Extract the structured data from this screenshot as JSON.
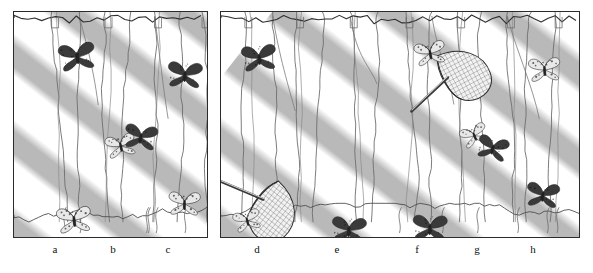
{
  "figure": {
    "panel_count": 2,
    "background_color": "#ffffff",
    "ink_color": "#2b2b2b",
    "shade_band_color": "#b9b9b9",
    "sun_band_color": "#ffffff",
    "dark_morph_color": "#3a3a3a",
    "pale_morph_color": "#e8e8e8"
  },
  "panels": [
    {
      "id": "panel-left",
      "name": "left-panel",
      "x": 13,
      "y": 11,
      "width": 195,
      "height": 227,
      "labels": [
        {
          "text": "a",
          "x": 55
        },
        {
          "text": "b",
          "x": 113
        },
        {
          "text": "c",
          "x": 168
        }
      ],
      "trunks_x": [
        38,
        66,
        92,
        118,
        142,
        168,
        190
      ],
      "butterflies": [
        {
          "name": "butterfly-dark-upper-left",
          "morph": "dark",
          "x": 63,
          "y": 44,
          "size": 40,
          "rot": -8
        },
        {
          "name": "butterfly-dark-upper-right",
          "morph": "dark",
          "x": 171,
          "y": 62,
          "size": 38,
          "rot": 4
        },
        {
          "name": "butterfly-pale-mid-pair",
          "morph": "pale",
          "x": 106,
          "y": 133,
          "size": 33,
          "rot": -12
        },
        {
          "name": "butterfly-dark-mid-pair",
          "morph": "dark",
          "x": 127,
          "y": 124,
          "size": 36,
          "rot": 8
        },
        {
          "name": "butterfly-pale-lower-left",
          "morph": "pale",
          "x": 60,
          "y": 207,
          "size": 38,
          "rot": -6
        },
        {
          "name": "butterfly-pale-lower-right",
          "morph": "pale",
          "x": 170,
          "y": 191,
          "size": 35,
          "rot": 2
        }
      ],
      "nets": []
    },
    {
      "id": "panel-right",
      "name": "right-panel",
      "x": 220,
      "y": 11,
      "width": 360,
      "height": 227,
      "labels": [
        {
          "text": "d",
          "x": 257
        },
        {
          "text": "e",
          "x": 337
        },
        {
          "text": "f",
          "x": 417
        },
        {
          "text": "g",
          "x": 477
        },
        {
          "text": "h",
          "x": 533
        }
      ],
      "trunks_x": [
        24,
        52,
        76,
        102,
        130,
        158,
        186,
        212,
        238,
        262,
        288,
        312,
        336
      ],
      "butterflies": [
        {
          "name": "butterfly-dark-upper-left",
          "morph": "dark",
          "x": 38,
          "y": 45,
          "size": 38,
          "rot": -6
        },
        {
          "name": "butterfly-pale-netted-lower",
          "morph": "pale",
          "x": 26,
          "y": 208,
          "size": 30,
          "rot": -14
        },
        {
          "name": "butterfly-dark-bottom-e",
          "morph": "dark",
          "x": 128,
          "y": 217,
          "size": 38,
          "rot": 4
        },
        {
          "name": "butterfly-pale-top-f",
          "morph": "pale",
          "x": 209,
          "y": 40,
          "size": 34,
          "rot": -10
        },
        {
          "name": "butterfly-dark-bottom-f",
          "morph": "dark",
          "x": 209,
          "y": 215,
          "size": 38,
          "rot": 2
        },
        {
          "name": "butterfly-pale-mid-g",
          "morph": "pale",
          "x": 253,
          "y": 123,
          "size": 30,
          "rot": -22
        },
        {
          "name": "butterfly-dark-mid-g",
          "morph": "dark",
          "x": 272,
          "y": 135,
          "size": 34,
          "rot": 14
        },
        {
          "name": "butterfly-pale-top-h",
          "morph": "pale",
          "x": 323,
          "y": 57,
          "size": 35,
          "rot": -4
        },
        {
          "name": "butterfly-dark-bottom-h",
          "morph": "dark",
          "x": 322,
          "y": 182,
          "size": 36,
          "rot": 6
        }
      ],
      "nets": [
        {
          "name": "net-lower-left",
          "x": 38,
          "y": 190,
          "size": 46,
          "rot": 38
        },
        {
          "name": "net-upper-mid",
          "x": 228,
          "y": 70,
          "size": 46,
          "rot": -28
        }
      ]
    }
  ]
}
